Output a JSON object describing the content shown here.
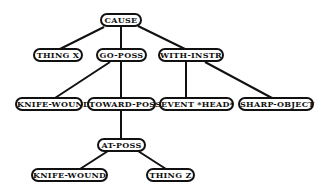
{
  "diagram": {
    "type": "tree",
    "colors": {
      "stroke": "#111111",
      "background": "#ffffff"
    },
    "nodes": [
      {
        "id": "cause",
        "label": "CAUSE",
        "x": 100,
        "y": 13,
        "w": 42
      },
      {
        "id": "thing-x",
        "label": "THING X",
        "x": 33,
        "y": 48,
        "w": 50
      },
      {
        "id": "go-poss",
        "label": "GO-POSS",
        "x": 96,
        "y": 48,
        "w": 51
      },
      {
        "id": "with-instr",
        "label": "WITH-INSTR",
        "x": 158,
        "y": 48,
        "w": 66
      },
      {
        "id": "knife-wound-1",
        "label": "KNIFE-WOUND",
        "x": 15,
        "y": 97,
        "w": 68
      },
      {
        "id": "toward-poss",
        "label": "TOWARD-POSS",
        "x": 87,
        "y": 97,
        "w": 69
      },
      {
        "id": "event-head",
        "label": "EVENT *HEAD*",
        "x": 159,
        "y": 97,
        "w": 75
      },
      {
        "id": "sharp-object",
        "label": "SHARP-OBJECT",
        "x": 238,
        "y": 97,
        "w": 76
      },
      {
        "id": "at-poss",
        "label": "AT-POSS",
        "x": 97,
        "y": 138,
        "w": 49
      },
      {
        "id": "knife-wound-2",
        "label": "KNIFE-WOUND",
        "x": 31,
        "y": 168,
        "w": 77
      },
      {
        "id": "thing-z",
        "label": "THING Z",
        "x": 146,
        "y": 168,
        "w": 49
      }
    ],
    "edges": [
      {
        "from": "cause",
        "to": "thing-x",
        "x1": 104,
        "y1": 27,
        "x2": 60,
        "y2": 49
      },
      {
        "from": "cause",
        "to": "go-poss",
        "x1": 121,
        "y1": 27,
        "x2": 121,
        "y2": 49
      },
      {
        "from": "cause",
        "to": "with-instr",
        "x1": 138,
        "y1": 26,
        "x2": 185,
        "y2": 49
      },
      {
        "from": "go-poss",
        "to": "knife-wound-1",
        "x1": 110,
        "y1": 62,
        "x2": 55,
        "y2": 98
      },
      {
        "from": "go-poss",
        "to": "toward-poss",
        "x1": 121,
        "y1": 62,
        "x2": 121,
        "y2": 98
      },
      {
        "from": "with-instr",
        "to": "event-head",
        "x1": 186,
        "y1": 62,
        "x2": 186,
        "y2": 98
      },
      {
        "from": "with-instr",
        "to": "sharp-object",
        "x1": 205,
        "y1": 62,
        "x2": 272,
        "y2": 98
      },
      {
        "from": "toward-poss",
        "to": "at-poss",
        "x1": 121,
        "y1": 111,
        "x2": 121,
        "y2": 139
      },
      {
        "from": "at-poss",
        "to": "knife-wound-2",
        "x1": 108,
        "y1": 151,
        "x2": 80,
        "y2": 169
      },
      {
        "from": "at-poss",
        "to": "thing-z",
        "x1": 138,
        "y1": 151,
        "x2": 166,
        "y2": 169
      }
    ]
  }
}
